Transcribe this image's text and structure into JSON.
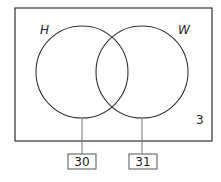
{
  "diagram": {
    "type": "venn",
    "sets": [
      {
        "label": "H",
        "pointer_value": "30"
      },
      {
        "label": "W",
        "pointer_value": "31"
      }
    ],
    "outside_value": "3",
    "colors": {
      "stroke": "#333333",
      "pointer_line": "#777777",
      "background": "#ffffff"
    }
  }
}
